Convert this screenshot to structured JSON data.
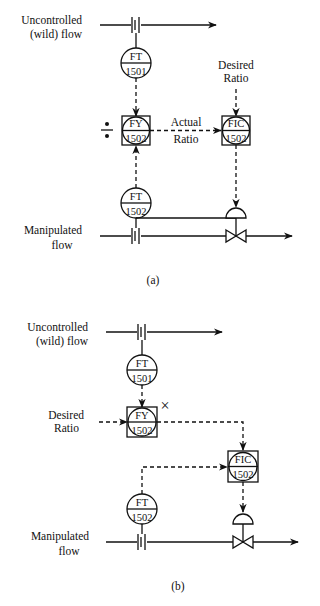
{
  "figure_a": {
    "caption": "(a)",
    "wild_flow_label": [
      "Uncontrolled",
      "(wild) flow"
    ],
    "manipulated_flow_label": [
      "Manipulated",
      "flow"
    ],
    "desired_ratio_label": [
      "Desired",
      "Ratio"
    ],
    "actual_ratio_label": [
      "Actual",
      "Ratio"
    ],
    "divide_symbol": "÷",
    "instruments": [
      {
        "id": "ft-1501",
        "func": "FT",
        "num": "1501",
        "type": "field-circle"
      },
      {
        "id": "fy-1502",
        "func": "FY",
        "num": "1502",
        "type": "shared-display-box"
      },
      {
        "id": "fic-1502",
        "func": "FIC",
        "num": "1502",
        "type": "shared-display-box"
      },
      {
        "id": "ft-1502",
        "func": "FT",
        "num": "1502",
        "type": "field-circle"
      }
    ]
  },
  "figure_b": {
    "caption": "(b)",
    "wild_flow_label": [
      "Uncontrolled",
      "(wild) flow"
    ],
    "manipulated_flow_label": [
      "Manipulated",
      "flow"
    ],
    "desired_ratio_label": [
      "Desired",
      "Ratio"
    ],
    "multiply_symbol": "×",
    "instruments": [
      {
        "id": "ft-1501",
        "func": "FT",
        "num": "1501",
        "type": "field-circle"
      },
      {
        "id": "fy-1502",
        "func": "FY",
        "num": "1502",
        "type": "shared-display-box"
      },
      {
        "id": "fic-1502",
        "func": "FIC",
        "num": "1502",
        "type": "shared-display-box"
      },
      {
        "id": "ft-1502",
        "func": "FT",
        "num": "1502",
        "type": "field-circle"
      }
    ]
  }
}
